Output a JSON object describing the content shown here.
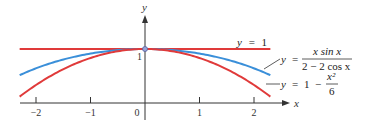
{
  "chart_data": {
    "type": "line",
    "title": "",
    "xlabel": "x",
    "ylabel": "y",
    "xlim": [
      -2.3,
      2.3
    ],
    "ylim": [
      0,
      1.2
    ],
    "x_ticks": [
      -2,
      -1,
      0,
      1,
      2
    ],
    "x_tick_labels": [
      "−2",
      "−1",
      "0",
      "1",
      "2"
    ],
    "y_ticks": [
      1
    ],
    "y_tick_labels": [
      "1"
    ],
    "grid": false,
    "series": [
      {
        "name": "y = 1",
        "function": "1",
        "color": "#e03a3a",
        "x_range": [
          -2.3,
          2.3
        ]
      },
      {
        "name": "y = x sin x / (2 − 2 cos x)",
        "function": "x*sin(x)/(2-2*cos(x))",
        "color": "#3a8fd9",
        "x_range": [
          -2.3,
          2.3
        ]
      },
      {
        "name": "y = 1 − x²/6",
        "function": "1 - x^2/6",
        "color": "#e03a3a",
        "x_range": [
          -2.3,
          2.3
        ]
      }
    ],
    "point": {
      "x": 0,
      "y": 1,
      "style": "open-circle"
    },
    "annotations": {
      "label_y1": {
        "lhs": "y",
        "eq": "=",
        "rhs": "1"
      },
      "label_blue": {
        "lhs": "y",
        "eq": "=",
        "numerator": "x sin x",
        "denominator": "2 − 2 cos x"
      },
      "label_red": {
        "lhs": "y",
        "eq": "=",
        "term1": "1",
        "minus": "−",
        "numerator": "x²",
        "denominator": "6"
      }
    }
  }
}
